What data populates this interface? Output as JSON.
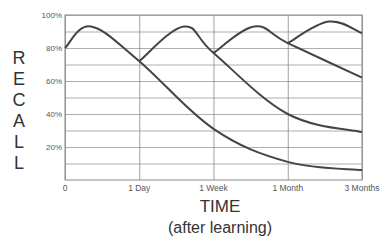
{
  "chart_data": {
    "type": "line",
    "title": "",
    "ylabel": "RECALL",
    "xlabel": "TIME",
    "xlabel_sub": "(after learning)",
    "ylim": [
      0,
      100
    ],
    "yticks": [
      "100%",
      "80%",
      "60%",
      "40%",
      "20%"
    ],
    "ytick_values": [
      100,
      80,
      60,
      40,
      20
    ],
    "xticks": [
      "0",
      "1 Day",
      "1 Week",
      "1 Month",
      "3 Months"
    ],
    "grid": true,
    "grid_minor_y": [
      90,
      70,
      50,
      30,
      10
    ],
    "legend": null,
    "series": [
      {
        "name": "Review 1 (initial learning)",
        "x": [
          0,
          0.35,
          1,
          2,
          3,
          4
        ],
        "values": [
          80,
          93,
          72,
          31,
          11,
          6
        ]
      },
      {
        "name": "Review 2 (after 1 Day)",
        "x": [
          1,
          1.6,
          2,
          3,
          4
        ],
        "values": [
          72,
          93,
          77,
          40,
          29
        ]
      },
      {
        "name": "Review 3 (after 1 Week)",
        "x": [
          2,
          2.55,
          3,
          4
        ],
        "values": [
          77,
          93,
          83,
          62
        ]
      },
      {
        "name": "Review 4 (after 1 Month)",
        "x": [
          3,
          3.55,
          4
        ],
        "values": [
          83,
          96,
          89
        ]
      }
    ],
    "color": "#444444"
  },
  "labels": {
    "recall_letters": [
      "R",
      "E",
      "C",
      "A",
      "L",
      "L"
    ],
    "time": "TIME",
    "after_learning": "(after learning)"
  }
}
